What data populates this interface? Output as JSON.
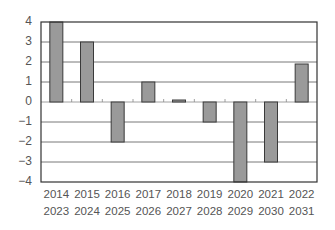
{
  "chart_data": {
    "type": "bar",
    "title": "",
    "xlabel": "",
    "ylabel": "",
    "categories": [
      [
        "2014",
        "2023"
      ],
      [
        "2015",
        "2024"
      ],
      [
        "2016",
        "2025"
      ],
      [
        "2017",
        "2026"
      ],
      [
        "2018",
        "2027"
      ],
      [
        "2019",
        "2028"
      ],
      [
        "2020",
        "2029"
      ],
      [
        "2021",
        "2030"
      ],
      [
        "2022",
        "2031"
      ]
    ],
    "values": [
      4,
      3,
      -2,
      1,
      0.1,
      -1,
      -4,
      -3,
      1.9
    ],
    "ylim": [
      -4,
      4
    ],
    "yticks": [
      "4",
      "3",
      "2",
      "1",
      "0",
      "-1",
      "-2",
      "-3",
      "-4"
    ],
    "grid": true,
    "legend": null,
    "colors": {
      "bar_fill": "#9a9a9a",
      "bar_stroke": "#3a3a3a",
      "grid": "#555555",
      "frame": "#333333"
    }
  }
}
